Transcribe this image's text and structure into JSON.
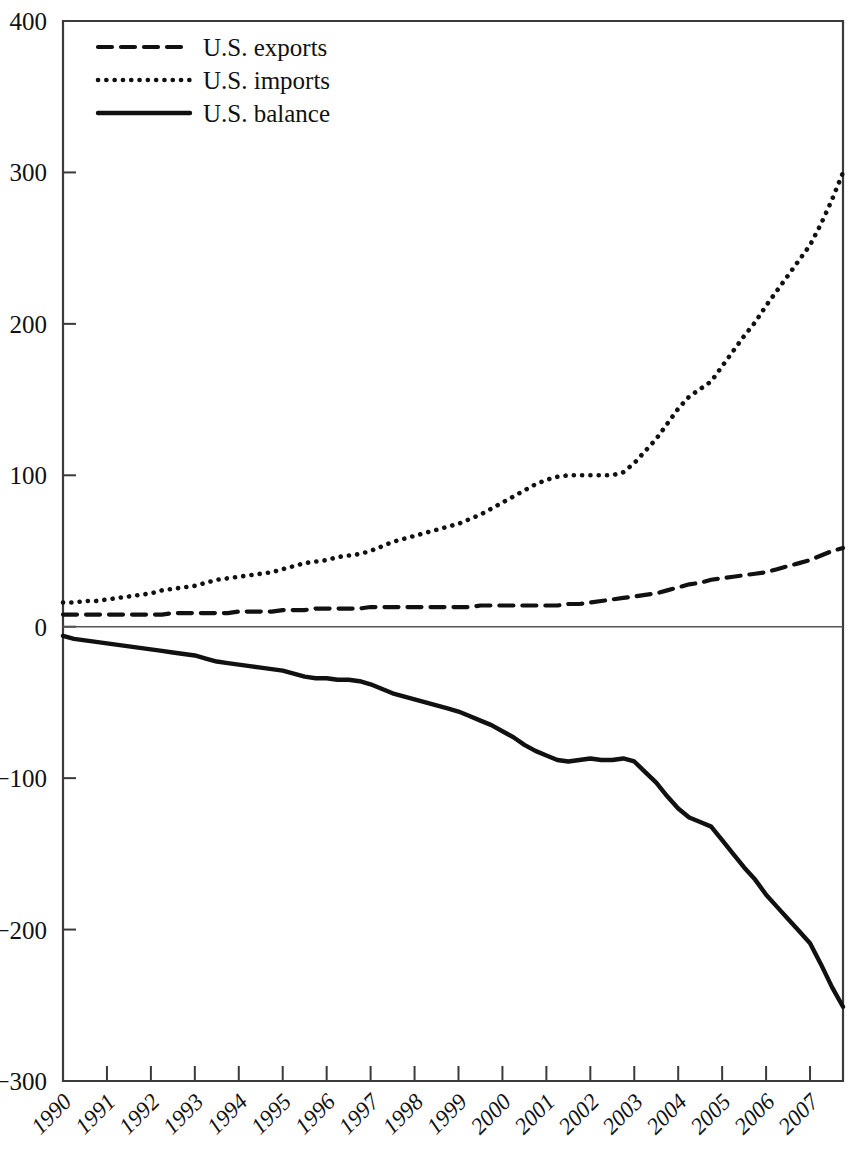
{
  "chart_data": {
    "type": "line",
    "title": "",
    "subtitle": "",
    "xlabel": "",
    "ylabel": "",
    "xlim": [
      1990,
      2007.75
    ],
    "ylim": [
      -300,
      400
    ],
    "grid": false,
    "legend_position": "top-left",
    "y_ticks": [
      "400",
      "300",
      "200",
      "100",
      "0",
      "-100",
      "-200",
      "-300"
    ],
    "y_tick_values": [
      400,
      300,
      200,
      100,
      0,
      -100,
      -200,
      -300
    ],
    "x_ticks": [
      "1990",
      "1991",
      "1992",
      "1993",
      "1994",
      "1995",
      "1996",
      "1997",
      "1998",
      "1999",
      "2000",
      "2001",
      "2002",
      "2003",
      "2004",
      "2005",
      "2006",
      "2007"
    ],
    "x_tick_values": [
      1990,
      1991,
      1992,
      1993,
      1994,
      1995,
      1996,
      1997,
      1998,
      1999,
      2000,
      2001,
      2002,
      2003,
      2004,
      2005,
      2006,
      2007
    ],
    "x": [
      1990.0,
      1990.25,
      1990.5,
      1990.75,
      1991.0,
      1991.25,
      1991.5,
      1991.75,
      1992.0,
      1992.25,
      1992.5,
      1992.75,
      1993.0,
      1993.25,
      1993.5,
      1993.75,
      1994.0,
      1994.25,
      1994.5,
      1994.75,
      1995.0,
      1995.25,
      1995.5,
      1995.75,
      1996.0,
      1996.25,
      1996.5,
      1996.75,
      1997.0,
      1997.25,
      1997.5,
      1997.75,
      1998.0,
      1998.25,
      1998.5,
      1998.75,
      1999.0,
      1999.25,
      1999.5,
      1999.75,
      2000.0,
      2000.25,
      2000.5,
      2000.75,
      2001.0,
      2001.25,
      2001.5,
      2001.75,
      2002.0,
      2002.25,
      2002.5,
      2002.75,
      2003.0,
      2003.25,
      2003.5,
      2003.75,
      2004.0,
      2004.25,
      2004.5,
      2004.75,
      2005.0,
      2005.25,
      2005.5,
      2005.75,
      2006.0,
      2006.25,
      2006.5,
      2006.75,
      2007.0,
      2007.25,
      2007.5,
      2007.75
    ],
    "series": [
      {
        "name": "U.S. exports",
        "style": "dashed",
        "color": "#111111",
        "values": [
          8,
          8,
          8,
          8,
          8,
          8,
          8,
          8,
          8,
          8,
          9,
          9,
          9,
          9,
          9,
          9,
          10,
          10,
          10,
          10,
          11,
          11,
          11,
          12,
          12,
          12,
          12,
          12,
          13,
          13,
          13,
          13,
          13,
          13,
          13,
          13,
          13,
          13,
          14,
          14,
          14,
          14,
          14,
          14,
          14,
          14,
          15,
          15,
          16,
          17,
          18,
          19,
          20,
          21,
          22,
          24,
          26,
          28,
          29,
          31,
          32,
          33,
          34,
          35,
          36,
          38,
          40,
          42,
          44,
          47,
          50,
          52
        ]
      },
      {
        "name": "U.S. imports",
        "style": "dotted",
        "color": "#111111",
        "values": [
          16,
          16,
          17,
          17,
          18,
          19,
          20,
          21,
          22,
          24,
          25,
          26,
          27,
          29,
          31,
          32,
          33,
          34,
          35,
          36,
          38,
          40,
          42,
          43,
          44,
          46,
          47,
          48,
          50,
          53,
          56,
          58,
          60,
          62,
          64,
          66,
          68,
          71,
          74,
          78,
          82,
          86,
          90,
          94,
          97,
          99,
          100,
          100,
          100,
          100,
          100,
          102,
          108,
          116,
          124,
          134,
          144,
          152,
          157,
          162,
          172,
          182,
          192,
          201,
          212,
          222,
          232,
          242,
          252,
          266,
          282,
          300
        ]
      },
      {
        "name": "U.S. balance",
        "style": "solid",
        "color": "#111111",
        "values": [
          -6,
          -8,
          -9,
          -10,
          -11,
          -12,
          -13,
          -14,
          -15,
          -16,
          -17,
          -18,
          -19,
          -21,
          -23,
          -24,
          -25,
          -26,
          -27,
          -28,
          -29,
          -31,
          -33,
          -34,
          -34,
          -35,
          -35,
          -36,
          -38,
          -41,
          -44,
          -46,
          -48,
          -50,
          -52,
          -54,
          -56,
          -59,
          -62,
          -65,
          -69,
          -73,
          -78,
          -82,
          -85,
          -88,
          -89,
          -88,
          -87,
          -88,
          -88,
          -87,
          -89,
          -96,
          -103,
          -112,
          -120,
          -126,
          -129,
          -132,
          -141,
          -150,
          -159,
          -167,
          -177,
          -185,
          -193,
          -201,
          -209,
          -223,
          -238,
          -251
        ]
      }
    ]
  },
  "legend": {
    "items": [
      {
        "label": "U.S. exports",
        "style": "dashed"
      },
      {
        "label": "U.S. imports",
        "style": "dotted"
      },
      {
        "label": "U.S. balance",
        "style": "solid"
      }
    ]
  }
}
